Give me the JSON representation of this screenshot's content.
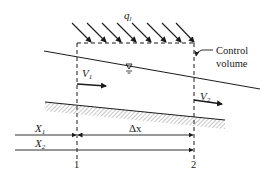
{
  "diagram": {
    "labels": {
      "lateral_inflow": "q",
      "lateral_inflow_sub": "l",
      "control_volume_line1": "Control",
      "control_volume_line2": "volume",
      "velocity1": "V",
      "velocity1_sub": "1",
      "velocity2": "V",
      "velocity2_sub": "2",
      "x1": "X",
      "x1_sub": "1",
      "x2": "X",
      "x2_sub": "2",
      "delta_x": "Δx",
      "section1": "1",
      "section2": "2",
      "water_surface_symbol": "∇"
    },
    "colors": {
      "ink": "#1a1a1a",
      "hatch": "#888888",
      "background": "#ffffff"
    }
  }
}
